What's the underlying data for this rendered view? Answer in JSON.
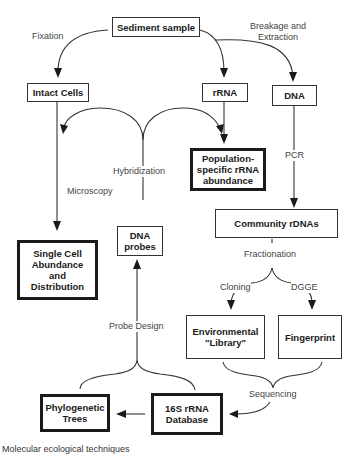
{
  "diagram": {
    "nodes": {
      "sediment_sample": "Sediment sample",
      "intact_cells": "Intact Cells",
      "rrna": "rRNA",
      "dna": "DNA",
      "population_specific": "Population-\nspecific rRNA\nabundance",
      "single_cell": "Single Cell\nAbundance\nand\nDistribution",
      "dna_probes": "DNA\nprobes",
      "community_rdnas": "Community rDNAs",
      "environmental_library": "Environmental\n\"Library\"",
      "fingerprint": "Fingerprint",
      "phylogenetic_trees": "Phylogenetic\nTrees",
      "database_16s": "16S rRNA\nDatabase"
    },
    "edge_labels": {
      "fixation": "Fixation",
      "breakage_extraction": "Breakage and\nExtraction",
      "hybridization": "Hybridization",
      "microscopy": "Microscopy",
      "pcr": "PCR",
      "fractionation": "Fractionation",
      "cloning": "Cloning",
      "dgge": "DGGE",
      "sequencing": "Sequencing",
      "probe_design": "Probe Design"
    },
    "caption": "Molecular ecological techniques"
  }
}
